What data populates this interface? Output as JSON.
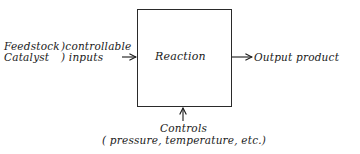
{
  "diagram": {
    "type": "block-process-diagram",
    "process_block": {
      "label": "Reaction"
    },
    "inputs": {
      "items": [
        "Feedstock",
        "Catalyst"
      ],
      "group_label_line1": ")controllable",
      "group_label_line2": ") inputs"
    },
    "output": {
      "label": "Output product"
    },
    "controls": {
      "label": "Controls",
      "detail": "( pressure, temperature, etc.)"
    },
    "colors": {
      "ink": "#1a1a1a",
      "background": "#ffffff"
    }
  }
}
